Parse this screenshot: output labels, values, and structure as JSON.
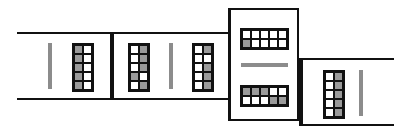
{
  "diagram": {
    "description": "Sequence of four tiles joined edge to edge, each containing a gray bar and ten-frame style grids",
    "colors": {
      "line": "#111111",
      "bar": "#8c8c8c",
      "filled_cell": "#9a9a9a",
      "empty_cell": "#ffffff"
    },
    "panels": [
      {
        "id": "panel-1",
        "orientation": "horizontal-open-left",
        "bar": "vertical",
        "grids": [
          {
            "layout": "2x5",
            "cells": [
              [
                1,
                0
              ],
              [
                1,
                0
              ],
              [
                1,
                0
              ],
              [
                1,
                0
              ],
              [
                1,
                0
              ]
            ]
          }
        ]
      },
      {
        "id": "panel-2",
        "orientation": "horizontal-closed",
        "bar": "vertical",
        "grids": [
          {
            "layout": "2x5",
            "cells": [
              [
                0,
                1
              ],
              [
                0,
                1
              ],
              [
                0,
                1
              ],
              [
                1,
                0
              ],
              [
                0,
                1
              ]
            ]
          },
          {
            "layout": "2x5",
            "cells": [
              [
                0,
                1
              ],
              [
                0,
                0
              ],
              [
                0,
                1
              ],
              [
                0,
                1
              ],
              [
                0,
                1
              ]
            ]
          }
        ]
      },
      {
        "id": "panel-3",
        "orientation": "vertical-tile",
        "bar": "horizontal",
        "grids": [
          {
            "layout": "5x2",
            "cells": [
              [
                0,
                0,
                0,
                0,
                0
              ],
              [
                1,
                0,
                0,
                0,
                0
              ]
            ]
          },
          {
            "layout": "5x2",
            "cells": [
              [
                1,
                1,
                1,
                0,
                0
              ],
              [
                0,
                0,
                0,
                1,
                1
              ]
            ]
          }
        ]
      },
      {
        "id": "panel-4",
        "orientation": "horizontal-open-right",
        "bar": "vertical",
        "grids": [
          {
            "layout": "2x5",
            "cells": [
              [
                0,
                1
              ],
              [
                0,
                1
              ],
              [
                0,
                1
              ],
              [
                0,
                1
              ],
              [
                0,
                1
              ]
            ]
          }
        ]
      }
    ]
  }
}
